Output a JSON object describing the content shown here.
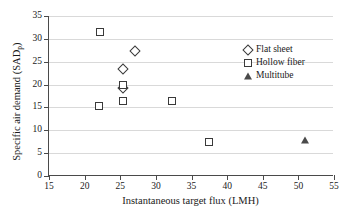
{
  "chart_data": {
    "type": "scatter",
    "title": "",
    "xlabel": "Instantaneous target flux (LMH)",
    "ylabel": "Specific air demand (SADp)",
    "ylabel_main": "Specific air demand (SAD",
    "ylabel_sub": "p",
    "ylabel_close": ")",
    "xlim": [
      15,
      55
    ],
    "ylim": [
      0,
      35
    ],
    "xticks": [
      15,
      20,
      25,
      30,
      35,
      40,
      45,
      50,
      55
    ],
    "yticks": [
      0,
      5,
      10,
      15,
      20,
      25,
      30,
      35
    ],
    "grid": "horizontal",
    "legend_position": "upper right",
    "series": [
      {
        "name": "Flat sheet",
        "marker": "diamond",
        "points": [
          {
            "x": 27.1,
            "y": 27.3
          },
          {
            "x": 25.4,
            "y": 23.5
          },
          {
            "x": 25.4,
            "y": 19.3
          }
        ]
      },
      {
        "name": "Hollow fiber",
        "marker": "square",
        "points": [
          {
            "x": 22.1,
            "y": 31.6
          },
          {
            "x": 25.4,
            "y": 20.0
          },
          {
            "x": 25.4,
            "y": 16.3
          },
          {
            "x": 22.0,
            "y": 15.4
          },
          {
            "x": 32.2,
            "y": 16.4
          },
          {
            "x": 37.5,
            "y": 7.4
          }
        ]
      },
      {
        "name": "Multitube",
        "marker": "triangle",
        "points": [
          {
            "x": 50.9,
            "y": 7.8
          }
        ]
      }
    ]
  },
  "legend": {
    "entries": [
      {
        "label": "Flat sheet",
        "marker": "diamond"
      },
      {
        "label": "Hollow fiber",
        "marker": "square"
      },
      {
        "label": "Multitube",
        "marker": "triangle"
      }
    ]
  },
  "colors": {
    "marker_stroke": "#3a3a3a",
    "axis": "#4a4a4a",
    "grid": "#d9d9d9",
    "background": "#ffffff"
  }
}
